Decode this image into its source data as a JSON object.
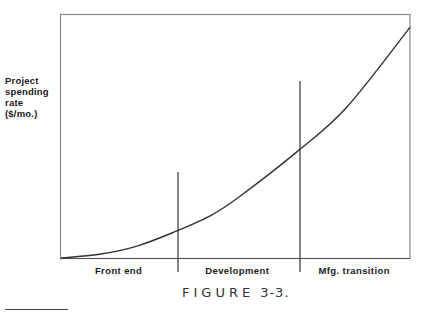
{
  "chart_data": {
    "type": "line",
    "title": "",
    "xlabel": "",
    "ylabel": "Project spending rate ($/mo.)",
    "ylabel_lines": [
      "Project",
      "spending",
      "rate",
      "($/mo.)"
    ],
    "grid": false,
    "legend": null,
    "axis_ticks": false,
    "series": [
      {
        "name": "Project spending rate",
        "description": "Accelerating (convex) curve, rising slowly in front end and steeply through manufacturing transition",
        "x_rel": [
          0.0,
          0.11,
          0.22,
          0.33,
          0.43,
          0.51,
          0.68,
          0.82,
          1.0
        ],
        "y_rel": [
          0.0,
          0.015,
          0.05,
          0.11,
          0.175,
          0.25,
          0.44,
          0.62,
          0.945
        ]
      }
    ],
    "phases": [
      {
        "label": "Front end",
        "x_start_rel": 0.0,
        "x_end_rel": 0.33
      },
      {
        "label": "Development",
        "x_start_rel": 0.33,
        "x_end_rel": 0.68
      },
      {
        "label": "Mfg. transition",
        "x_start_rel": 0.68,
        "x_end_rel": 1.0
      }
    ],
    "dividers_x_rel": [
      0.33,
      0.68
    ],
    "caption": "FIGURE 3-3."
  },
  "figure": {
    "caption_word": "FIGURE",
    "caption_number": "3-3."
  }
}
